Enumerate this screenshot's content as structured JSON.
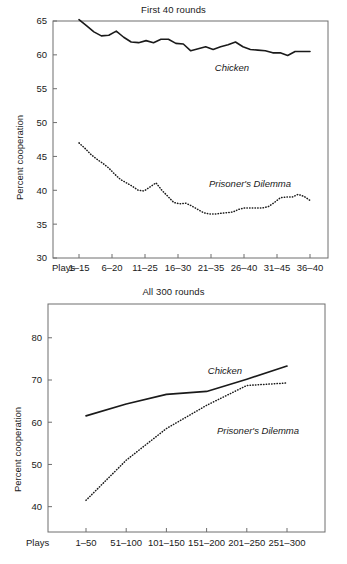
{
  "figure": {
    "axis_title": "Percent cooperation",
    "plays_label": "Plays"
  },
  "chart_data": [
    {
      "type": "line",
      "title": "First 40 rounds",
      "xlabel": "Plays",
      "ylabel": "Percent cooperation",
      "ylim": [
        30,
        65
      ],
      "yticks": [
        30,
        35,
        40,
        45,
        50,
        55,
        60,
        65
      ],
      "grid": false,
      "legend_position": "inline-annotation",
      "categories": [
        "1–15",
        "6–20",
        "11–25",
        "16–30",
        "21–35",
        "26–40",
        "31–45",
        "36–40"
      ],
      "x_index": [
        1,
        2,
        3,
        4,
        5,
        6,
        7,
        8,
        9,
        10,
        11,
        12,
        13,
        14,
        15,
        16,
        17,
        18,
        19,
        20,
        21,
        22,
        23,
        24,
        25,
        26
      ],
      "series": [
        {
          "name": "Chicken",
          "style": "solid",
          "values": [
            65.2,
            64.3,
            63.4,
            62.8,
            62.9,
            63.5,
            62.6,
            61.9,
            61.8,
            62.1,
            61.8,
            62.3,
            62.3,
            61.7,
            61.6,
            60.6,
            60.9,
            61.2,
            60.8,
            61.2,
            61.5,
            61.9,
            61.2,
            60.8,
            60.7,
            60.6,
            60.3,
            60.3,
            59.9,
            60.5,
            60.5,
            60.5
          ]
        },
        {
          "name": "Prisoner's Dilemma",
          "style": "dotted",
          "values": [
            47.0,
            46.2,
            45.3,
            44.6,
            44.0,
            43.3,
            42.4,
            41.6,
            41.1,
            40.6,
            40.0,
            39.9,
            40.5,
            41.1,
            40.0,
            39.1,
            38.2,
            38.0,
            38.1,
            37.7,
            37.2,
            36.7,
            36.5,
            36.5,
            36.6,
            36.7,
            36.8,
            37.2,
            37.4,
            37.4,
            37.4,
            37.4,
            37.6,
            38.2,
            38.9,
            39.0,
            39.0,
            39.4,
            39.1,
            38.5
          ]
        }
      ]
    },
    {
      "type": "line",
      "title": "All 300 rounds",
      "xlabel": "Plays",
      "ylabel": "Percent cooperation",
      "ylim": [
        34,
        88
      ],
      "yticks": [
        40,
        50,
        60,
        70,
        80
      ],
      "yticklabels": [
        "40",
        "50",
        "60",
        "70",
        "80"
      ],
      "grid": false,
      "legend_position": "inline-annotation",
      "categories": [
        "1–50",
        "51–100",
        "101–150",
        "151–200",
        "201–250",
        "251–300"
      ],
      "series": [
        {
          "name": "Chicken",
          "style": "solid",
          "values": [
            61.5,
            64.3,
            66.6,
            67.3,
            70.2,
            73.3
          ]
        },
        {
          "name": "Prisoner's Dilemma",
          "style": "dotted",
          "values": [
            41.5,
            51.0,
            58.5,
            64.0,
            68.7,
            69.3
          ]
        }
      ]
    }
  ]
}
